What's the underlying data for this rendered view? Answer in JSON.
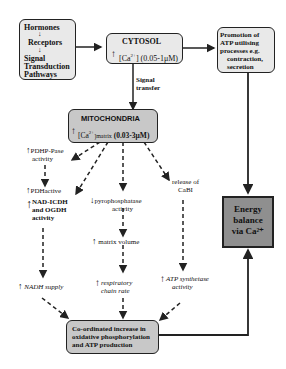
{
  "boxes": {
    "hormones": {
      "lines": [
        "Hormones",
        "Receptors",
        "Signal",
        "Transduction",
        "Pathways"
      ]
    },
    "cytosol": {
      "title": "CYTOSOL",
      "ca": "[Ca",
      "sup": "2+",
      "range": "] (0.05-1μM)"
    },
    "promotion": {
      "lines": [
        "Promotion of",
        "ATP utilising",
        "processes e.g.",
        "contraction,",
        "secretion"
      ]
    },
    "mitochondria": {
      "title": "MITOCHONDRIA",
      "ca": "[Ca",
      "sup": "2+",
      "sub": "]matrix",
      "range": "(0.03-3μM)"
    },
    "energy": {
      "lines": [
        "Energy",
        "balance",
        "via Ca²⁺"
      ]
    },
    "coordinated": {
      "lines": [
        "Co-ordinated increase in",
        "oxidative phosphorylation",
        "and ATP production"
      ]
    }
  },
  "labels": {
    "signal_transfer": [
      "Signal",
      "transfer"
    ],
    "pdhp": [
      "PDHP-Pase",
      "activity"
    ],
    "pdh": "PDHactive",
    "nad": [
      "NAD-ICDH",
      "and OGDH",
      "activity"
    ],
    "pyro": [
      "pyrophosphatase",
      "activity"
    ],
    "matrix_volume": "matrix volume",
    "release": [
      "release of",
      "CaBI"
    ],
    "nadh": "NADH supply",
    "resp": [
      "respiratory",
      "chain rate"
    ],
    "atp": [
      "ATP synthetase",
      "activity"
    ]
  },
  "arrows": {
    "up": "↑",
    "down": "↓"
  },
  "colors": {
    "box_fill": "#e9e9e9",
    "mito_fill": "#c8c8c8",
    "energy_fill": "#8f8f8f",
    "line": "#222222"
  }
}
